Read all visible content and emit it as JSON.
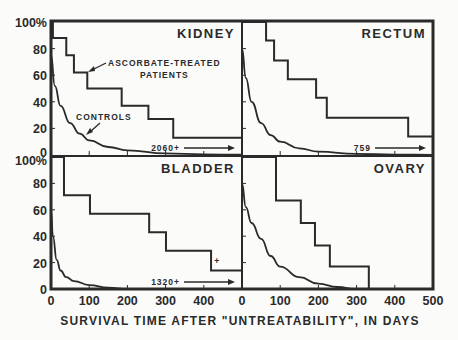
{
  "chart_data": {
    "type": "line",
    "title": "",
    "xlabel": "SURVIVAL TIME AFTER \"UNTREATABILITY\", IN DAYS",
    "ylabel": "",
    "xlim": [
      0,
      500
    ],
    "ylim": [
      0,
      100
    ],
    "x_ticks": [
      0,
      100,
      200,
      300,
      400,
      500
    ],
    "y_ticks": [
      0,
      20,
      40,
      60,
      80,
      100
    ],
    "y_tick_labels": [
      "0",
      "20",
      "40",
      "60",
      "80",
      "100%"
    ],
    "grid": false,
    "legend": "inline annotations",
    "annotations": {
      "treated_label": "ASCORBATE-TREATED",
      "treated_label_2": "PATIENTS",
      "controls_label": "CONTROLS"
    },
    "panels": [
      {
        "name": "KIDNEY",
        "position": "top-left",
        "tail_note": "2060+",
        "series": [
          {
            "name": "Ascorbate-treated patients",
            "type": "step",
            "x": [
              0,
              5,
              40,
              60,
              95,
              185,
              255,
              320,
              500
            ],
            "y": [
              100,
              88,
              75,
              62,
              50,
              37,
              27,
              13,
              13
            ]
          },
          {
            "name": "Controls",
            "type": "curve",
            "x": [
              0,
              10,
              25,
              50,
              75,
              100,
              150,
              200,
              300,
              400,
              500
            ],
            "y": [
              75,
              52,
              37,
              24,
              16,
              11,
              6,
              3.5,
              1.2,
              0.5,
              0.2
            ]
          }
        ]
      },
      {
        "name": "RECTUM",
        "position": "top-right",
        "tail_note": "759",
        "series": [
          {
            "name": "Ascorbate-treated patients",
            "type": "step",
            "x": [
              0,
              63,
              84,
              120,
              194,
              222,
              435,
              500
            ],
            "y": [
              100,
              86,
              71,
              57,
              43,
              28,
              14,
              14
            ]
          },
          {
            "name": "Controls",
            "type": "curve",
            "x": [
              0,
              10,
              25,
              50,
              75,
              100,
              150,
              200,
              300,
              400,
              500
            ],
            "y": [
              80,
              58,
              40,
              24,
              15,
              10,
              5,
              2.5,
              0.8,
              0.3,
              0.1
            ]
          }
        ]
      },
      {
        "name": "BLADDER",
        "position": "bottom-left",
        "tail_note": "1320+",
        "censor_mark": {
          "x": 435,
          "y": 19,
          "label": "+"
        },
        "series": [
          {
            "name": "Ascorbate-treated patients",
            "type": "step",
            "x": [
              0,
              34,
              102,
              257,
              301,
              419,
              500
            ],
            "y": [
              100,
              71,
              57,
              43,
              29,
              14,
              14
            ]
          },
          {
            "name": "Controls",
            "type": "curve",
            "x": [
              0,
              5,
              15,
              25,
              40,
              60,
              100,
              150,
              200
            ],
            "y": [
              60,
              40,
              22,
              14,
              9,
              6,
              3,
              1,
              0
            ]
          }
        ]
      },
      {
        "name": "OVARY",
        "position": "bottom-right",
        "tail_note": "",
        "series": [
          {
            "name": "Ascorbate-treated patients",
            "type": "step",
            "x": [
              0,
              89,
              154,
              191,
              230,
              332
            ],
            "y": [
              100,
              67,
              50,
              33,
              17,
              0
            ]
          },
          {
            "name": "Controls",
            "type": "curve",
            "x": [
              0,
              10,
              25,
              50,
              75,
              100,
              150,
              200,
              250,
              300
            ],
            "y": [
              80,
              62,
              50,
              38,
              25,
              17,
              9,
              4,
              1.5,
              0
            ]
          }
        ]
      }
    ]
  }
}
